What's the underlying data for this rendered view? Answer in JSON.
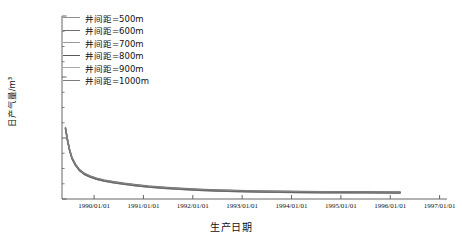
{
  "chart_data": {
    "type": "line",
    "title": "",
    "xlabel": "生产日期",
    "ylabel": "日产气量/m³",
    "grid": false,
    "legend_position": "upper-left-inside",
    "x_tick_labels": [
      "1990/01/01",
      "1991/01/01",
      "1992/01/01",
      "1993/01/01",
      "1994/01/01",
      "1995/01/01",
      "1996/01/01",
      "1997/01/01"
    ],
    "x_tick_positions": [
      1990.0,
      1991.0,
      1992.0,
      1993.0,
      1994.0,
      1995.0,
      1996.0,
      1997.0
    ],
    "xlim": [
      1989.35,
      1997.15
    ],
    "y_tick_labels": [
      "0",
      "1×10⁵",
      "2×10⁵",
      "3×10⁵"
    ],
    "y_tick_values": [
      0,
      100000,
      200000,
      300000
    ],
    "ylim": [
      0,
      300000
    ],
    "y_minor_ticks": [
      25000,
      50000,
      75000,
      125000,
      150000,
      175000,
      225000,
      250000,
      275000
    ],
    "x": [
      1989.42,
      1989.46,
      1989.5,
      1989.55,
      1989.62,
      1989.7,
      1989.8,
      1989.92,
      1990.05,
      1990.2,
      1990.4,
      1990.62,
      1990.85,
      1991.1,
      1991.4,
      1991.75,
      1992.1,
      1992.5,
      1992.9,
      1993.3,
      1993.75,
      1994.2,
      1994.65,
      1995.1,
      1995.55,
      1995.95,
      1996.2
    ],
    "series": [
      {
        "name": "井间距=500m",
        "label": "井间距=500m",
        "color": "#8f8f8f",
        "width": 0.9,
        "values": [
          115000,
          96000,
          80000,
          66000,
          55000,
          46500,
          40000,
          35500,
          32000,
          29000,
          26200,
          23600,
          21300,
          19200,
          17300,
          15500,
          14000,
          12800,
          11900,
          11200,
          10700,
          10300,
          10000,
          9800,
          9650,
          9550,
          9500
        ]
      },
      {
        "name": "井间距=600m",
        "label": "井间距=600m",
        "color": "#6d6d6d",
        "width": 1.5,
        "values": [
          115500,
          96500,
          80600,
          66600,
          55500,
          47000,
          40500,
          36000,
          32400,
          29400,
          26600,
          24000,
          21700,
          19600,
          17700,
          15900,
          14400,
          13200,
          12300,
          11600,
          11100,
          10700,
          10400,
          10200,
          10050,
          9950,
          9900
        ]
      },
      {
        "name": "井间距=700m",
        "label": "井间距=700m",
        "color": "#9a9a9a",
        "width": 0.9,
        "values": [
          116000,
          97000,
          81200,
          67200,
          56000,
          47500,
          41000,
          36500,
          32900,
          29900,
          27100,
          24500,
          22200,
          20100,
          18200,
          16400,
          14900,
          13700,
          12800,
          12100,
          11600,
          11200,
          10900,
          10700,
          10550,
          10450,
          10400
        ]
      },
      {
        "name": "井间距=800m",
        "label": "井间距=800m",
        "color": "#5a5a5a",
        "width": 1.6,
        "values": [
          116500,
          97500,
          81800,
          67800,
          56600,
          48000,
          41500,
          37000,
          33400,
          30400,
          27600,
          25000,
          22700,
          20600,
          18700,
          16900,
          15400,
          14200,
          13300,
          12600,
          12100,
          11700,
          11400,
          11200,
          11050,
          10950,
          10900
        ]
      },
      {
        "name": "井间距=900m",
        "label": "井间距=900m",
        "color": "#a6a6a6",
        "width": 0.8,
        "values": [
          117000,
          98000,
          82400,
          68400,
          57200,
          48500,
          42000,
          37500,
          33900,
          30900,
          28100,
          25500,
          23200,
          21100,
          19200,
          17400,
          15900,
          14700,
          13800,
          13100,
          12600,
          12200,
          11900,
          11700,
          11550,
          11450,
          11400
        ]
      },
      {
        "name": "井间距=1000m",
        "label": "井间距=1000m",
        "color": "#7c7c7c",
        "width": 1.1,
        "values": [
          117500,
          98500,
          83000,
          69000,
          57800,
          49000,
          42500,
          38000,
          34400,
          31400,
          28600,
          26000,
          23700,
          21600,
          19700,
          17900,
          16400,
          15200,
          14300,
          13600,
          13100,
          12700,
          12400,
          12200,
          12050,
          11950,
          11900
        ]
      }
    ]
  },
  "axis": {
    "axis_color": "#555555",
    "tick_color": "#555555"
  }
}
